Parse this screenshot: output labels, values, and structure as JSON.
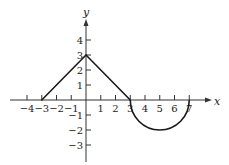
{
  "chart_data": {
    "type": "line",
    "title": "",
    "xlabel": "x",
    "ylabel": "y",
    "xlim": [
      -4,
      7
    ],
    "ylim": [
      -3,
      4
    ],
    "grid": false,
    "x_ticks": [
      -4,
      -3,
      -2,
      -1,
      1,
      2,
      3,
      4,
      5,
      6,
      7
    ],
    "x_tick_labels": [
      "−4",
      "−3",
      "−2",
      "−1",
      "1",
      "2",
      "3",
      "4",
      "5",
      "6",
      "7"
    ],
    "y_ticks": [
      4,
      3,
      2,
      1,
      -1,
      -2,
      -3
    ],
    "y_tick_labels": [
      "4",
      "3",
      "2",
      "1",
      "−1",
      "−2",
      "−3"
    ],
    "series": [
      {
        "name": "f(x)",
        "segments": [
          {
            "kind": "line",
            "points": [
              [
                -3,
                0
              ],
              [
                0,
                3
              ]
            ]
          },
          {
            "kind": "line",
            "points": [
              [
                0,
                3
              ],
              [
                3,
                0
              ]
            ]
          },
          {
            "kind": "semicircle",
            "center": [
              5,
              0
            ],
            "radius": 2,
            "from": [
              3,
              0
            ],
            "to": [
              7,
              0
            ],
            "side": "below"
          }
        ]
      }
    ]
  },
  "labels": {
    "x_axis": "x",
    "y_axis": "y"
  },
  "style": {
    "curve_color": "#1a1a1a",
    "axis_color": "#333333"
  }
}
